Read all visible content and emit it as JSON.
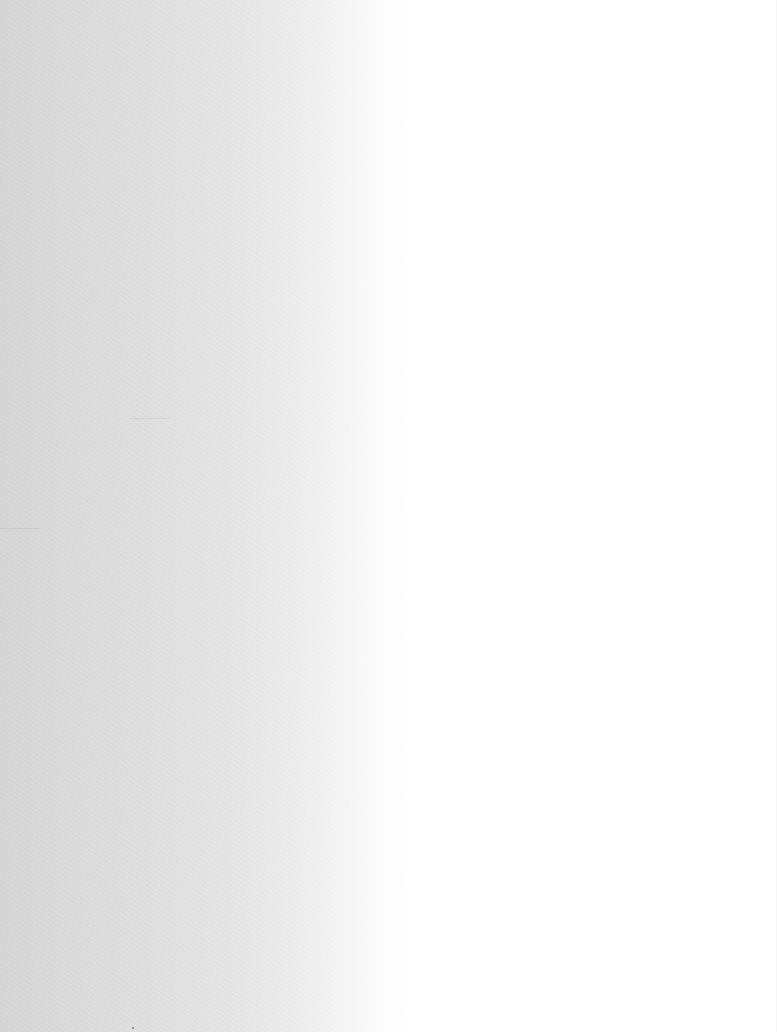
{
  "page": {
    "kind": "blank-paper-scan",
    "visible_text": "",
    "colors": {
      "left_edge": "#d6d6d6",
      "mid_fade": "#e6e6e6",
      "paper": "#ffffff"
    }
  }
}
